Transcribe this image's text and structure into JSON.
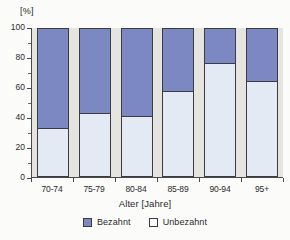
{
  "chart_data": {
    "type": "bar",
    "subtype": "stacked-100-percent",
    "title": "",
    "xlabel": "Alter [Jahre]",
    "ylabel": "[%]",
    "categories": [
      "70-74",
      "75-79",
      "80-84",
      "85-89",
      "90-94",
      "95+"
    ],
    "series": [
      {
        "name": "Bezahnt",
        "color": "#7b88c2",
        "values": [
          68,
          58,
          60,
          43,
          24,
          36
        ]
      },
      {
        "name": "Unbezahnt",
        "color": "#e3eaf3",
        "values": [
          32,
          42,
          40,
          57,
          76,
          64
        ]
      }
    ],
    "ylim": [
      0,
      100
    ],
    "yticks": [
      0,
      20,
      40,
      60,
      80,
      100
    ],
    "ytick_labels": [
      "0",
      "20",
      "40",
      "60",
      "80",
      "100"
    ],
    "y_minor_ticks": [
      10,
      30,
      50,
      70,
      90
    ],
    "grid": false,
    "legend_position": "bottom-center",
    "legend": [
      {
        "label": "Bezahnt",
        "swatch": "filled"
      },
      {
        "label": "Unbezahnt",
        "swatch": "empty"
      }
    ],
    "plot_background": "#e6e4de",
    "figure_background": "#fbfbfa"
  }
}
